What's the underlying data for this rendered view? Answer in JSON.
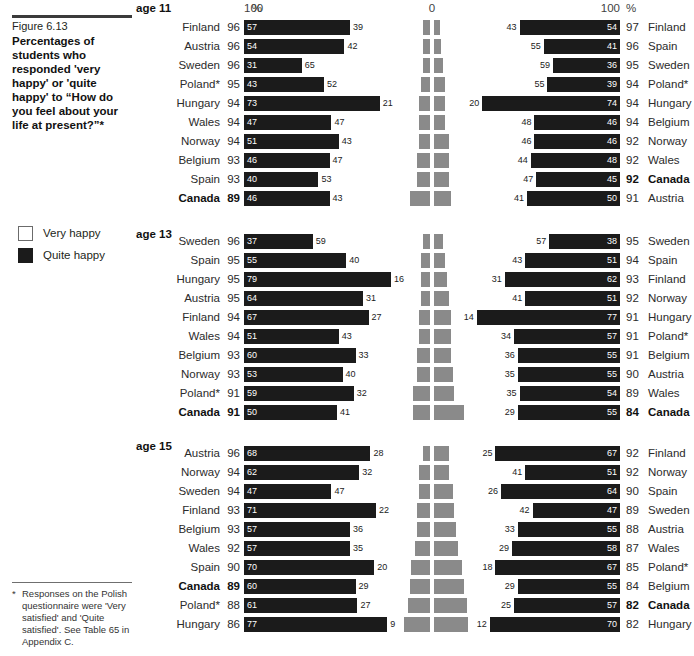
{
  "caption": {
    "figure_number": "Figure 6.13",
    "title": "Percentages of students who responded 'very happy' or 'quite happy' to “How do you feel about your life at present?”*"
  },
  "legend": {
    "items": [
      {
        "label": "Very happy",
        "color": "#ffffff",
        "key": "very"
      },
      {
        "label": "Quite happy",
        "color": "#1b1b1b",
        "key": "quite"
      }
    ]
  },
  "footnote": {
    "marker": "*",
    "text": "Responses on the Polish questionnaire were 'Very satisfied' and 'Quite satisfied'. See Table 65 in Appendix C."
  },
  "axis": {
    "left_label": "100",
    "center_label": "0",
    "right_label": "100",
    "pct_left": "%",
    "pct_right": "%"
  },
  "chart_data": {
    "type": "bar",
    "title": "Percentages of students who responded 'very happy' or 'quite happy' to “How do you feel about your life at present?”*",
    "orientation": "horizontal-bidirectional",
    "stacked": true,
    "xlabel": "",
    "ylabel": "",
    "xlim": [
      0,
      100
    ],
    "grid": false,
    "legend_position": "left",
    "series": [
      {
        "name": "Quite happy",
        "color": "#1b1b1b"
      },
      {
        "name": "Very happy",
        "color": "#ffffff"
      }
    ],
    "panels": [
      {
        "name": "age 11",
        "left_side": {
          "rows": [
            {
              "country": "Finland",
              "total": 96,
              "quite": 57,
              "very": 39,
              "bold": false
            },
            {
              "country": "Austria",
              "total": 96,
              "quite": 54,
              "very": 42,
              "bold": false
            },
            {
              "country": "Sweden",
              "total": 96,
              "quite": 31,
              "very": 65,
              "bold": false
            },
            {
              "country": "Poland*",
              "total": 95,
              "quite": 43,
              "very": 52,
              "bold": false
            },
            {
              "country": "Hungary",
              "total": 94,
              "quite": 73,
              "very": 21,
              "bold": false
            },
            {
              "country": "Wales",
              "total": 94,
              "quite": 47,
              "very": 47,
              "bold": false
            },
            {
              "country": "Norway",
              "total": 94,
              "quite": 51,
              "very": 43,
              "bold": false
            },
            {
              "country": "Belgium",
              "total": 93,
              "quite": 46,
              "very": 47,
              "bold": false
            },
            {
              "country": "Spain",
              "total": 93,
              "quite": 40,
              "very": 53,
              "bold": false
            },
            {
              "country": "Canada",
              "total": 89,
              "quite": 46,
              "very": 43,
              "bold": true
            }
          ]
        },
        "right_side": {
          "rows": [
            {
              "country": "Finland",
              "total": 97,
              "very": 43,
              "quite": 54,
              "bold": false
            },
            {
              "country": "Spain",
              "total": 96,
              "very": 55,
              "quite": 41,
              "bold": false
            },
            {
              "country": "Sweden",
              "total": 95,
              "very": 59,
              "quite": 36,
              "bold": false
            },
            {
              "country": "Poland*",
              "total": 94,
              "very": 55,
              "quite": 39,
              "bold": false
            },
            {
              "country": "Hungary",
              "total": 94,
              "very": 20,
              "quite": 74,
              "bold": false
            },
            {
              "country": "Belgium",
              "total": 94,
              "very": 48,
              "quite": 46,
              "bold": false
            },
            {
              "country": "Norway",
              "total": 92,
              "very": 46,
              "quite": 46,
              "bold": false
            },
            {
              "country": "Wales",
              "total": 92,
              "very": 44,
              "quite": 48,
              "bold": false
            },
            {
              "country": "Canada",
              "total": 92,
              "very": 47,
              "quite": 45,
              "bold": true
            },
            {
              "country": "Austria",
              "total": 91,
              "very": 41,
              "quite": 50,
              "bold": false
            }
          ]
        }
      },
      {
        "name": "age 13",
        "left_side": {
          "rows": [
            {
              "country": "Sweden",
              "total": 96,
              "quite": 37,
              "very": 59,
              "bold": false
            },
            {
              "country": "Spain",
              "total": 95,
              "quite": 55,
              "very": 40,
              "bold": false
            },
            {
              "country": "Hungary",
              "total": 95,
              "quite": 79,
              "very": 16,
              "bold": false
            },
            {
              "country": "Austria",
              "total": 95,
              "quite": 64,
              "very": 31,
              "bold": false
            },
            {
              "country": "Finland",
              "total": 94,
              "quite": 67,
              "very": 27,
              "bold": false
            },
            {
              "country": "Wales",
              "total": 94,
              "quite": 51,
              "very": 43,
              "bold": false
            },
            {
              "country": "Belgium",
              "total": 93,
              "quite": 60,
              "very": 33,
              "bold": false
            },
            {
              "country": "Norway",
              "total": 93,
              "quite": 53,
              "very": 40,
              "bold": false
            },
            {
              "country": "Poland*",
              "total": 91,
              "quite": 59,
              "very": 32,
              "bold": false
            },
            {
              "country": "Canada",
              "total": 91,
              "quite": 50,
              "very": 41,
              "bold": true
            }
          ]
        },
        "right_side": {
          "rows": [
            {
              "country": "Sweden",
              "total": 95,
              "very": 57,
              "quite": 38,
              "bold": false
            },
            {
              "country": "Spain",
              "total": 94,
              "very": 43,
              "quite": 51,
              "bold": false
            },
            {
              "country": "Finland",
              "total": 93,
              "very": 31,
              "quite": 62,
              "bold": false
            },
            {
              "country": "Norway",
              "total": 92,
              "very": 41,
              "quite": 51,
              "bold": false
            },
            {
              "country": "Hungary",
              "total": 91,
              "very": 14,
              "quite": 77,
              "bold": false
            },
            {
              "country": "Poland*",
              "total": 91,
              "very": 34,
              "quite": 57,
              "bold": false
            },
            {
              "country": "Belgium",
              "total": 91,
              "very": 36,
              "quite": 55,
              "bold": false
            },
            {
              "country": "Austria",
              "total": 90,
              "very": 35,
              "quite": 55,
              "bold": false
            },
            {
              "country": "Wales",
              "total": 89,
              "very": 35,
              "quite": 54,
              "bold": false
            },
            {
              "country": "Canada",
              "total": 84,
              "very": 29,
              "quite": 55,
              "bold": true
            }
          ]
        }
      },
      {
        "name": "age 15",
        "left_side": {
          "rows": [
            {
              "country": "Austria",
              "total": 96,
              "quite": 68,
              "very": 28,
              "bold": false
            },
            {
              "country": "Norway",
              "total": 94,
              "quite": 62,
              "very": 32,
              "bold": false
            },
            {
              "country": "Sweden",
              "total": 94,
              "quite": 47,
              "very": 47,
              "bold": false
            },
            {
              "country": "Finland",
              "total": 93,
              "quite": 71,
              "very": 22,
              "bold": false
            },
            {
              "country": "Belgium",
              "total": 93,
              "quite": 57,
              "very": 36,
              "bold": false
            },
            {
              "country": "Wales",
              "total": 92,
              "quite": 57,
              "very": 35,
              "bold": false
            },
            {
              "country": "Spain",
              "total": 90,
              "quite": 70,
              "very": 20,
              "bold": false
            },
            {
              "country": "Canada",
              "total": 89,
              "quite": 60,
              "very": 29,
              "bold": true
            },
            {
              "country": "Poland*",
              "total": 88,
              "quite": 61,
              "very": 27,
              "bold": false
            },
            {
              "country": "Hungary",
              "total": 86,
              "quite": 77,
              "very": 9,
              "bold": false
            }
          ]
        },
        "right_side": {
          "rows": [
            {
              "country": "Finland",
              "total": 92,
              "very": 25,
              "quite": 67,
              "bold": false
            },
            {
              "country": "Norway",
              "total": 92,
              "very": 41,
              "quite": 51,
              "bold": false
            },
            {
              "country": "Spain",
              "total": 90,
              "very": 26,
              "quite": 64,
              "bold": false
            },
            {
              "country": "Sweden",
              "total": 89,
              "very": 42,
              "quite": 47,
              "bold": false
            },
            {
              "country": "Austria",
              "total": 88,
              "very": 33,
              "quite": 55,
              "bold": false
            },
            {
              "country": "Wales",
              "total": 87,
              "very": 29,
              "quite": 58,
              "bold": false
            },
            {
              "country": "Poland*",
              "total": 85,
              "very": 18,
              "quite": 67,
              "bold": false
            },
            {
              "country": "Belgium",
              "total": 84,
              "very": 29,
              "quite": 55,
              "bold": false
            },
            {
              "country": "Canada",
              "total": 82,
              "very": 25,
              "quite": 57,
              "bold": true
            },
            {
              "country": "Hungary",
              "total": 82,
              "very": 12,
              "quite": 70,
              "bold": false
            }
          ]
        }
      }
    ]
  }
}
